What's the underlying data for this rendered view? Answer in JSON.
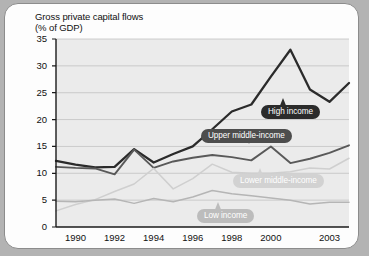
{
  "chart_data": {
    "type": "line",
    "title": "Gross private capital flows\n(% of GDP)",
    "xlabel": "",
    "ylabel": "% of GDP",
    "ylim": [
      0,
      35
    ],
    "ytick_values": [
      0,
      5,
      10,
      15,
      20,
      25,
      30,
      35
    ],
    "ytick_labels": [
      "0",
      "5",
      "10",
      "15",
      "20",
      "25",
      "30",
      "35"
    ],
    "xlim": [
      1989,
      2004
    ],
    "xtick_values": [
      1990,
      1992,
      1994,
      1996,
      1998,
      2000,
      2003
    ],
    "xtick_labels": [
      "1990",
      "1992",
      "1994",
      "1996",
      "1998",
      "2000",
      "2003"
    ],
    "grid": "horizontal",
    "legend_position": "inline-callout",
    "x": [
      1989,
      1990,
      1991,
      1992,
      1993,
      1994,
      1995,
      1996,
      1997,
      1998,
      1999,
      2000,
      2001,
      2002,
      2003,
      2004
    ],
    "series": [
      {
        "name": "High income",
        "color": "#2b2b2b",
        "values": [
          12.3,
          11.6,
          11.1,
          11.2,
          14.5,
          12.0,
          13.6,
          15.0,
          18.2,
          21.5,
          22.8,
          28.0,
          33.0,
          25.6,
          23.3,
          26.8
        ]
      },
      {
        "name": "Upper middle-income",
        "color": "#595959",
        "values": [
          11.2,
          11.0,
          10.9,
          9.8,
          14.4,
          11.0,
          12.2,
          12.9,
          13.4,
          13.0,
          12.4,
          15.0,
          11.9,
          12.7,
          13.8,
          15.2
        ]
      },
      {
        "name": "Lower middle-income",
        "color": "#cfcfcf",
        "values": [
          3.0,
          4.2,
          5.1,
          6.6,
          8.0,
          10.9,
          7.1,
          9.0,
          11.7,
          10.2,
          10.0,
          10.0,
          10.3,
          11.0,
          10.8,
          12.8
        ]
      },
      {
        "name": "Low income",
        "color": "#b5b5b5",
        "values": [
          4.8,
          4.7,
          5.0,
          5.2,
          4.4,
          5.3,
          4.7,
          5.6,
          6.8,
          6.2,
          5.8,
          5.4,
          5.0,
          4.3,
          4.6,
          4.6
        ]
      }
    ],
    "callouts": [
      {
        "label": "High income",
        "style": "pill-high",
        "x": 256,
        "y": 101,
        "pointer": {
          "x": 278,
          "y": 94,
          "dir": "up"
        }
      },
      {
        "label": "Upper middle-income",
        "style": "pill-upper",
        "x": 196,
        "y": 125,
        "pointer": {
          "x": 244,
          "y": 140,
          "dir": "down"
        }
      },
      {
        "label": "Lower middle-income",
        "style": "pill-lowermid",
        "x": 228,
        "y": 170,
        "pointer": {
          "x": 255,
          "y": 164,
          "dir": "up"
        }
      },
      {
        "label": "Low income",
        "style": "pill-low",
        "x": 192,
        "y": 205,
        "pointer": {
          "x": 213,
          "y": 198,
          "dir": "up"
        }
      }
    ]
  }
}
